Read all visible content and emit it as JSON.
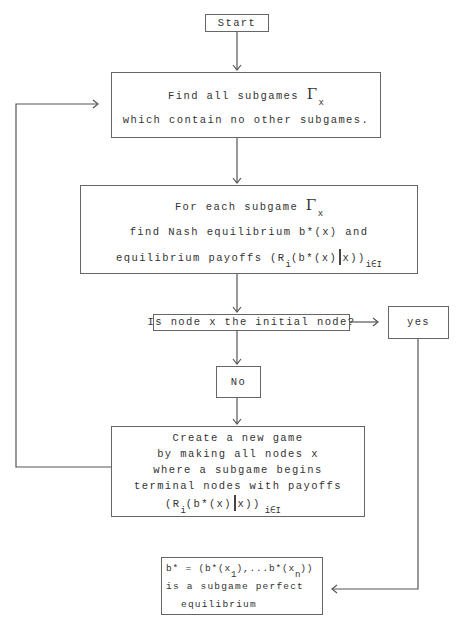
{
  "start": {
    "label": "Start"
  },
  "step1": {
    "line1": "Find all subgames ",
    "gamma": "Γ",
    "gamma_sub": "x",
    "line2": "which contain no other subgames."
  },
  "step2": {
    "line1": "For each subgame ",
    "gamma": "Γ",
    "gamma_sub": "x",
    "line2": "find Nash equilibrium b*(x) and",
    "line3_pre": "equilibrium payoffs (R",
    "line3_sub_i": "i",
    "line3_mid": "(b*(x)",
    "line3_post": "x))",
    "line3_sub_set": "i∈I"
  },
  "decision": {
    "label": "Is node x the initial node?"
  },
  "yes": {
    "label": "yes"
  },
  "no": {
    "label": "No"
  },
  "step3": {
    "line1": "Create a new game",
    "line2": "by making all nodes x",
    "line3": "where a subgame begins",
    "line4": "terminal nodes with payoffs",
    "line5_pre": "(R",
    "line5_sub_i": "i",
    "line5_mid": "(b*(x)",
    "line5_post": "x))",
    "line5_sub_set": "i∈I"
  },
  "result": {
    "line1_pre": "b* = (b*(x",
    "line1_sub1": "1",
    "line1_mid": "),...b*(x",
    "line1_subn": "n",
    "line1_post": "))",
    "line2": "is a subgame perfect",
    "line3": "equilibrium"
  }
}
